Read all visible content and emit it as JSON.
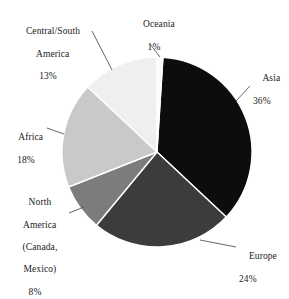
{
  "chart_data": {
    "type": "pie",
    "title": "",
    "subtitle": "",
    "xlabel": "",
    "ylabel": "",
    "legend_position": "none",
    "grid": false,
    "units": "percent",
    "total": 100,
    "start_angle_deg": 0,
    "direction": "clockwise",
    "categories": [
      "Asia",
      "Europe",
      "North America (Canada, Mexico)",
      "Africa",
      "Central/South America",
      "Oceania"
    ],
    "values": [
      36,
      24,
      8,
      18,
      13,
      1
    ],
    "slices": [
      {
        "name": "Asia",
        "label_line1": "Asia",
        "value": 36,
        "value_label": "36%",
        "color": "#0d0d0d",
        "start_deg": 3.6,
        "end_deg": 133.2
      },
      {
        "name": "Europe",
        "label_line1": "Europe",
        "value": 24,
        "value_label": "24%",
        "color": "#3c3c3c",
        "start_deg": 133.2,
        "end_deg": 219.6
      },
      {
        "name": "North America",
        "label_line1": "North",
        "label_line2": "America",
        "label_line3": "(Canada,",
        "label_line4": "Mexico)",
        "value": 8,
        "value_label": "8%",
        "color": "#7c7c7c",
        "start_deg": 219.6,
        "end_deg": 248.4
      },
      {
        "name": "Africa",
        "label_line1": "Africa",
        "value": 18,
        "value_label": "18%",
        "color": "#c9c9c9",
        "start_deg": 248.4,
        "end_deg": 313.2
      },
      {
        "name": "Central/South America",
        "label_line1": "Central/South",
        "label_line2": "America",
        "value": 13,
        "value_label": "13%",
        "color": "#efefef",
        "start_deg": 313.2,
        "end_deg": 360
      },
      {
        "name": "Oceania",
        "label_line1": "Oceania",
        "value": 1,
        "value_label": "1%",
        "color": "#fbfbfb",
        "start_deg": 0,
        "end_deg": 3.6
      }
    ],
    "slice_border_color": "#ffffff",
    "background_color": "#ffffff",
    "text_color": "#1a1a1a",
    "leader_line_color": "#555555"
  }
}
